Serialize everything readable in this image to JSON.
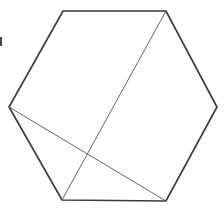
{
  "figure": {
    "type": "line-drawing",
    "canvas": {
      "width": 224,
      "height": 208
    },
    "background_color": "#ffffff",
    "shape": {
      "name": "hexagon",
      "sides": 6,
      "fill_color": "#ffffff",
      "stroke_color": "#3a3a3a",
      "stroke_width": 1.7,
      "vertices": [
        {
          "label": "top-left",
          "x": 63,
          "y": 11
        },
        {
          "label": "top-right",
          "x": 166,
          "y": 11
        },
        {
          "label": "right",
          "x": 217,
          "y": 107
        },
        {
          "label": "bottom-right",
          "x": 166,
          "y": 201
        },
        {
          "label": "bottom-left",
          "x": 62,
          "y": 200
        },
        {
          "label": "left",
          "x": 9,
          "y": 107
        }
      ],
      "points_attr": "63,11 166,11 217,107 166,201 62,200 9,107"
    },
    "diagonals": [
      {
        "name": "diagonal-top-right-to-bottom-left",
        "from": {
          "label": "top-right",
          "x": 166,
          "y": 11
        },
        "to": {
          "label": "bottom-left",
          "x": 62,
          "y": 200
        },
        "stroke_color": "#555555",
        "stroke_width": 0.9
      },
      {
        "name": "diagonal-left-to-bottom-right",
        "from": {
          "label": "left",
          "x": 9,
          "y": 107
        },
        "to": {
          "label": "bottom-right",
          "x": 166,
          "y": 201
        },
        "stroke_color": "#555555",
        "stroke_width": 0.9
      }
    ],
    "intersection": {
      "label": "diagonal-crossing-point",
      "x": 87,
      "y": 155
    },
    "marks": [
      {
        "name": "left-edge-tick",
        "x": 1,
        "y1": 37,
        "y2": 46,
        "stroke_color": "#4a4a4a",
        "stroke_width": 2.2
      }
    ]
  }
}
